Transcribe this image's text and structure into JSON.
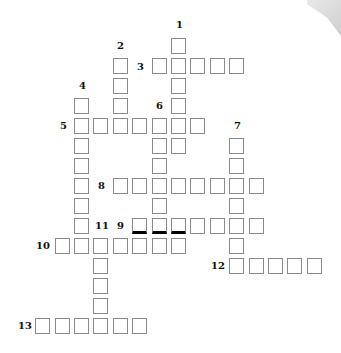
{
  "puzzle": {
    "type": "crossword",
    "clue_numbers": [
      "1",
      "2",
      "3",
      "4",
      "5",
      "6",
      "7",
      "8",
      "9",
      "10",
      "11",
      "12",
      "13"
    ],
    "entries": [
      {
        "number": "1",
        "direction": "down",
        "length": 6,
        "start": {
          "col": 5,
          "row": 0
        }
      },
      {
        "number": "2",
        "direction": "down",
        "length": 4,
        "start": {
          "col": 2,
          "row": 1
        }
      },
      {
        "number": "3",
        "direction": "across",
        "length": 5,
        "start": {
          "col": 4,
          "row": 1
        }
      },
      {
        "number": "4",
        "direction": "down",
        "length": 7,
        "start": {
          "col": 0,
          "row": 3
        }
      },
      {
        "number": "5",
        "direction": "across",
        "length": 7,
        "start": {
          "col": 0,
          "row": 4
        }
      },
      {
        "number": "6",
        "direction": "down",
        "length": 7,
        "start": {
          "col": 4,
          "row": 4
        }
      },
      {
        "number": "7",
        "direction": "down",
        "length": 7,
        "start": {
          "col": 8,
          "row": 5
        }
      },
      {
        "number": "8",
        "direction": "across",
        "length": 8,
        "start": {
          "col": 2,
          "row": 7
        }
      },
      {
        "number": "9",
        "direction": "across",
        "length": 7,
        "start": {
          "col": 3,
          "row": 9
        }
      },
      {
        "number": "10",
        "direction": "across",
        "length": 7,
        "start": {
          "col": -1,
          "row": 10
        }
      },
      {
        "number": "11",
        "direction": "down",
        "length": 5,
        "start": {
          "col": 1,
          "row": 10
        }
      },
      {
        "number": "12",
        "direction": "across",
        "length": 5,
        "start": {
          "col": 8,
          "row": 11
        }
      },
      {
        "number": "13",
        "direction": "across",
        "length": 6,
        "start": {
          "col": -2,
          "row": 14
        }
      }
    ],
    "labels": [
      {
        "text": "1",
        "x": 176,
        "y": 20
      },
      {
        "text": "2",
        "x": 117,
        "y": 41
      },
      {
        "text": "3",
        "x": 137,
        "y": 62
      },
      {
        "text": "4",
        "x": 79,
        "y": 81
      },
      {
        "text": "5",
        "x": 60,
        "y": 121
      },
      {
        "text": "6",
        "x": 156,
        "y": 101
      },
      {
        "text": "7",
        "x": 234,
        "y": 121
      },
      {
        "text": "8",
        "x": 98,
        "y": 181
      },
      {
        "text": "9",
        "x": 117,
        "y": 221
      },
      {
        "text": "10",
        "x": 36,
        "y": 241
      },
      {
        "text": "11",
        "x": 95,
        "y": 221
      },
      {
        "text": "12",
        "x": 211,
        "y": 261
      },
      {
        "text": "13",
        "x": 18,
        "y": 321
      }
    ],
    "thick_cells": [
      [
        3,
        9
      ],
      [
        4,
        9
      ],
      [
        5,
        9
      ]
    ]
  }
}
